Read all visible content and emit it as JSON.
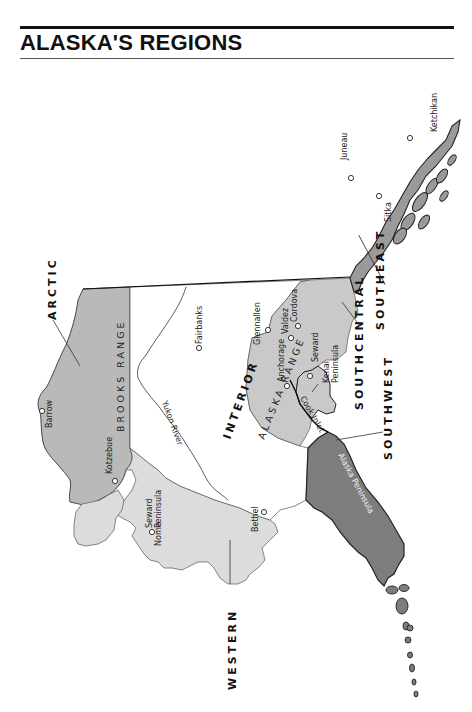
{
  "page": {
    "title": "ALASKA'S REGIONS"
  },
  "colors": {
    "arctic_fill": "#b9b9b9",
    "southcentral_fill": "#c9c9c9",
    "western_fill": "#dcdcdc",
    "southwest_fill": "#7d7d7d",
    "southeast_fill": "#9a9a9a",
    "interior_fill": "#ffffff",
    "outline": "#222222"
  },
  "regions": {
    "arctic": "ARCTIC",
    "interior": "INTERIOR",
    "western": "WESTERN",
    "southwest": "SOUTHWEST",
    "southcentral": "SOUTHCENTRAL",
    "southeast": "SOUTHEAST"
  },
  "features": {
    "brooks_range": "BROOKS RANGE",
    "alaska_range": "ALASKA RANGE",
    "yukon_river": "Yukon River",
    "cook_inlet": "Cook Inlet",
    "alaska_peninsula": "Alaska Peninsula",
    "seward_peninsula": [
      "Seward",
      "Peninsula"
    ],
    "kenai_peninsula": [
      "Kenai",
      "Peninsula"
    ]
  },
  "towns": {
    "barrow": "Barrow",
    "kotzebue": "Kotzebue",
    "nome": "Nome",
    "bethel": "Bethel",
    "fairbanks": "Fairbanks",
    "anchorage": "Anchorage",
    "glennallen": "Glennallen",
    "valdez": "Valdez",
    "cordova": "Cordova",
    "seward": "Seward",
    "juneau": "Juneau",
    "sitka": "Sitka",
    "ketchikan": "Ketchikan"
  }
}
